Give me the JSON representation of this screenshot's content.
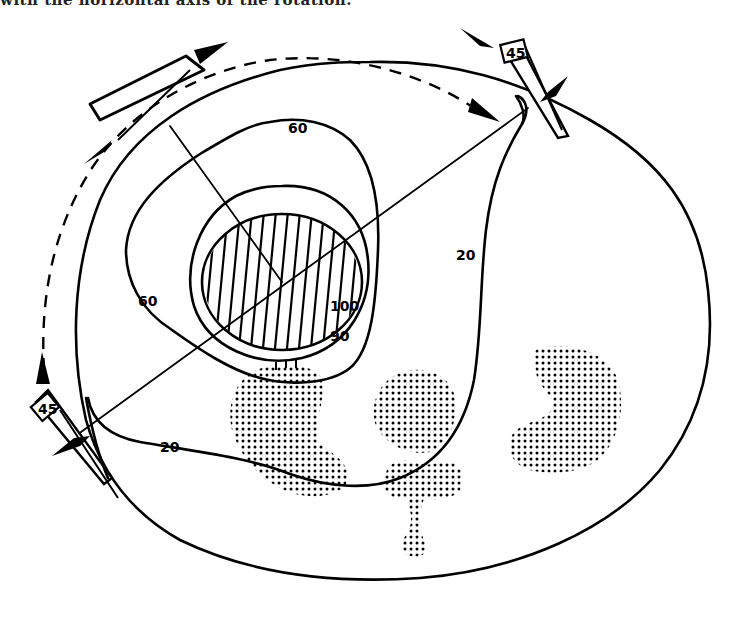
{
  "caption": "with the horizontal axis of the rotation.",
  "diagram": {
    "type": "radiotherapy isodose plan (cross-section)",
    "isodose_labels": {
      "iso_60_top": "60",
      "iso_60_left": "60",
      "iso_20_right": "20",
      "iso_20_bottom": "20",
      "iso_100": "100",
      "iso_90": "90"
    },
    "wedge_labels": {
      "wedge_top_right": "45",
      "wedge_left": "45"
    },
    "colors": {
      "ink": "#000000",
      "background": "#ffffff"
    }
  }
}
